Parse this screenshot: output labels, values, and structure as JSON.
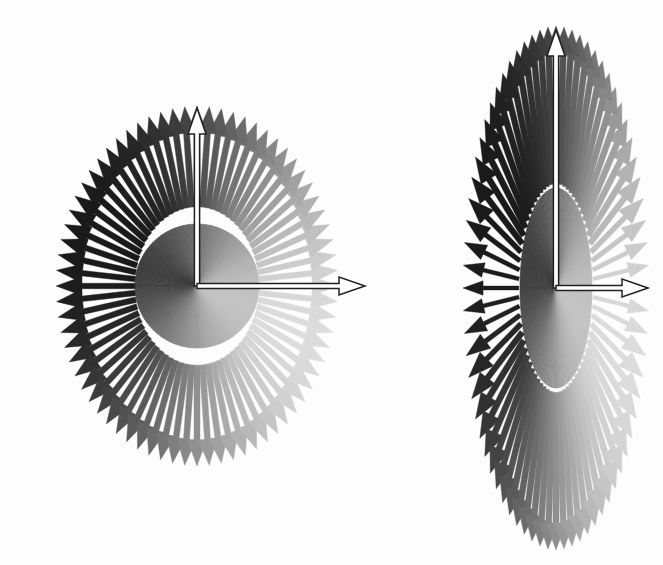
{
  "document": {
    "title": "Radial Vector Field Diagrams",
    "background_color": "#fdfdfd",
    "width": 663,
    "height": 565,
    "figure_count": 2
  },
  "palette": {
    "darkest_arrow": "#1a1a1a",
    "mid_arrow": "#707070",
    "lightest_arrow": "#d8d8d8",
    "disc_dark": "#3c3c3c",
    "disc_light": "#c2c2c2",
    "reference_arrow_fill": "#ffffff",
    "reference_arrow_stroke": "#202020",
    "background": "#fdfdfd"
  },
  "chart_data": {
    "type": "scatter",
    "subtitle": "Two polar arrow (quiver) plots: circular pattern at left, vertically elongated pattern at right",
    "xlabel": "",
    "ylabel": "",
    "legend": [],
    "grid": false,
    "figures": [
      {
        "name": "left-figure",
        "label": "circular radial arrow pattern",
        "center_x": 197,
        "center_y": 286,
        "outer_radius_x": 141,
        "outer_radius_y": 180,
        "inner_disc_radius_x": 62,
        "inner_disc_radius_y": 62,
        "arrow_count": 72,
        "angle_step_degrees": 5,
        "shaft_start_fraction": 0.44,
        "shading": {
          "dark_direction_degrees": 160,
          "light_direction_degrees": 340,
          "min_gray": "#1a1a1a",
          "max_gray": "#dcdcdc"
        },
        "reference_arrows": [
          {
            "name": "vertical-reference-arrow",
            "direction": "up",
            "angle_degrees": 90,
            "length": 178,
            "style": "hollow-outline"
          },
          {
            "name": "horizontal-reference-arrow",
            "direction": "right",
            "angle_degrees": 0,
            "length": 168,
            "style": "hollow-outline"
          }
        ]
      },
      {
        "name": "right-figure",
        "label": "vertically elongated radial arrow pattern",
        "center_x": 556,
        "center_y": 288,
        "outer_radius_x": 93,
        "outer_radius_y": 262,
        "inner_disc_radius_x": 36,
        "inner_disc_radius_y": 100,
        "arrow_count": 72,
        "angle_step_degrees": 5,
        "shaft_start_fraction": 0.4,
        "shading": {
          "dark_direction_degrees": 160,
          "light_direction_degrees": 340,
          "min_gray": "#1a1a1a",
          "max_gray": "#dcdcdc"
        },
        "reference_arrows": [
          {
            "name": "vertical-reference-arrow",
            "direction": "up",
            "angle_degrees": 90,
            "length": 258,
            "style": "hollow-outline"
          },
          {
            "name": "horizontal-reference-arrow",
            "direction": "right",
            "angle_degrees": 0,
            "length": 92,
            "style": "hollow-outline"
          }
        ]
      }
    ],
    "notes": [
      "Each figure consists of arrows radiating outward from a common center.",
      "Arrow grayscale varies smoothly with azimuth: darkest toward the upper-left, lightest toward the lower-right.",
      "A solid shaded disc/ellipse fills the inner region of each figure with the same directional shading.",
      "Two hollow white-filled reference arrows (one pointing up, one pointing right) overlay each figure."
    ]
  }
}
